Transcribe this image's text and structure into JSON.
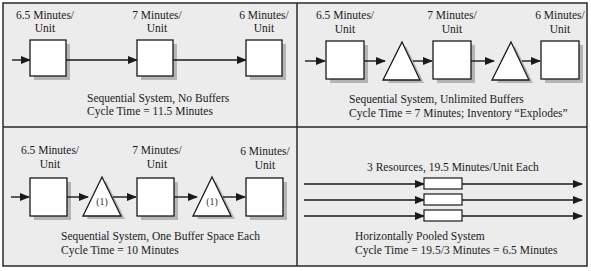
{
  "colors": {
    "panel_bg": "#ececec",
    "border": "#2a2a2a",
    "shape_fill": "#ffffff",
    "shadow": "#b5b5b5"
  },
  "panels": [
    {
      "id": "no-buffers",
      "stations": [
        {
          "rate_line1": "6.5 Minutes/",
          "rate_line2": "Unit"
        },
        {
          "rate_line1": "7 Minutes/",
          "rate_line2": "Unit"
        },
        {
          "rate_line1": "6 Minutes/",
          "rate_line2": "Unit"
        }
      ],
      "caption_line1": "Sequential System, No Buffers",
      "caption_line2": "Cycle Time = 11.5 Minutes"
    },
    {
      "id": "unlimited-buffers",
      "stations": [
        {
          "rate_line1": "6.5 Minutes/",
          "rate_line2": "Unit"
        },
        {
          "rate_line1": "7 Minutes/",
          "rate_line2": "Unit"
        },
        {
          "rate_line1": "6 Minutes/",
          "rate_line2": "Unit"
        }
      ],
      "caption_line1": "Sequential System, Unlimited Buffers",
      "caption_line2": "Cycle Time = 7 Minutes; Inventory “Explodes”"
    },
    {
      "id": "one-buffer",
      "stations": [
        {
          "rate_line1": "6.5 Minutes/",
          "rate_line2": "Unit"
        },
        {
          "rate_line1": "7 Minutes/",
          "rate_line2": "Unit"
        },
        {
          "rate_line1": "6 Minutes/",
          "rate_line2": "Unit"
        }
      ],
      "buffers": [
        "(1)",
        "(1)"
      ],
      "caption_line1": "Sequential System, One Buffer Space Each",
      "caption_line2": "Cycle Time = 10 Minutes"
    },
    {
      "id": "pooled",
      "header": "3 Resources, 19.5 Minutes/Unit Each",
      "caption_line1": "Horizontally Pooled System",
      "caption_line2": "Cycle Time = 19.5/3 Minutes = 6.5 Minutes"
    }
  ]
}
